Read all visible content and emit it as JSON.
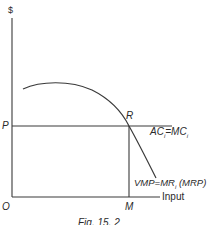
{
  "diagram": {
    "y_axis_label": "$",
    "x_axis_label": "Input",
    "origin_label": "O",
    "price_label": "P",
    "equilibrium_point_label": "R",
    "quantity_label": "M",
    "supply_line_label": {
      "text_a": "AC",
      "sub_a": "i",
      "eq": "=",
      "text_b": "MC",
      "sub_b": "i"
    },
    "demand_curve_label": {
      "text_a": "VMP",
      "eq": "=",
      "text_b": "MR",
      "sub_b": "i",
      "text_c": "(MRP)"
    },
    "caption": "Fig. 15. 2",
    "colors": {
      "line": "#3a3a3a",
      "background": "#ffffff"
    }
  }
}
